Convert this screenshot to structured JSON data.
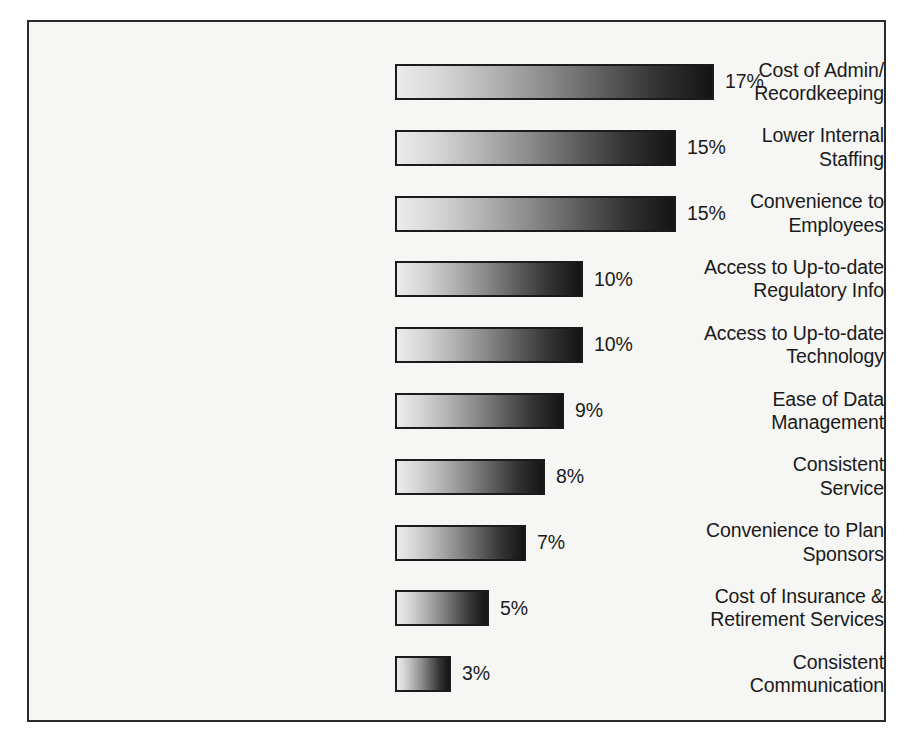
{
  "chart_data": {
    "type": "bar",
    "orientation": "horizontal",
    "title": "",
    "subtitle": "",
    "xlabel": "",
    "ylabel": "",
    "xlim": [
      0,
      17
    ],
    "grid": false,
    "legend": null,
    "value_suffix": "%",
    "categories": [
      "Cost of Admin/\nRecordkeeping",
      "Lower Internal\nStaffing",
      "Convenience to\nEmployees",
      "Access to Up-to-date\nRegulatory Info",
      "Access to Up-to-date\nTechnology",
      "Ease of Data\nManagement",
      "Consistent\nService",
      "Convenience to Plan\nSponsors",
      "Cost of Insurance &\nRetirement Services",
      "Consistent\nCommunication"
    ],
    "values": [
      17,
      15,
      15,
      10,
      10,
      9,
      8,
      7,
      5,
      3
    ],
    "value_labels": [
      "17%",
      "15%",
      "15%",
      "10%",
      "10%",
      "9%",
      "8%",
      "7%",
      "5%",
      "3%"
    ],
    "bar_style": {
      "gradient_start": "#ebebeb",
      "gradient_end": "#141414",
      "border_color": "#1b1b1b"
    },
    "frame": {
      "border_color": "#2b2b2b",
      "background": "#f6f6f4"
    }
  }
}
